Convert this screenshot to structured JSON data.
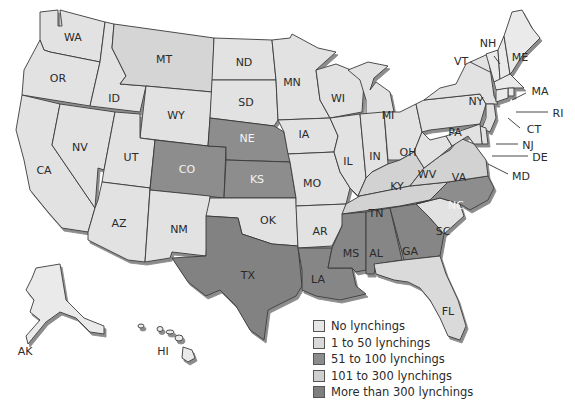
{
  "map": {
    "type": "choropleth",
    "region": "United States",
    "colors": {
      "none": "#e6e6e6",
      "1_50": "#d9d9d9",
      "51_100": "#8c8c8c",
      "101_300": "#c9c9c9",
      "over_300": "#7f7f7f"
    },
    "legend": [
      {
        "key": "none",
        "label": "No lynchings",
        "color": "#e6e6e6"
      },
      {
        "key": "1_50",
        "label": "1 to 50 lynchings",
        "color": "#d9d9d9"
      },
      {
        "key": "51_100",
        "label": "51 to 100 lynchings",
        "color": "#8c8c8c"
      },
      {
        "key": "101_300",
        "label": "101 to 300 lynchings",
        "color": "#cfcfcf"
      },
      {
        "key": "over_300",
        "label": "More than 300 lynchings",
        "color": "#7f7f7f"
      }
    ],
    "states": {
      "WA": "WA",
      "OR": "OR",
      "CA": "CA",
      "ID": "ID",
      "NV": "NV",
      "MT": "MT",
      "WY": "WY",
      "UT": "UT",
      "AZ": "AZ",
      "CO": "CO",
      "NM": "NM",
      "ND": "ND",
      "SD": "SD",
      "NE": "NE",
      "KS": "KS",
      "OK": "OK",
      "TX": "TX",
      "MN": "MN",
      "IA": "IA",
      "MO": "MO",
      "AR": "AR",
      "LA": "LA",
      "WI": "WI",
      "IL": "IL",
      "MI": "MI",
      "IN": "IN",
      "OH": "OH",
      "KY": "KY",
      "TN": "TN",
      "MS": "MS",
      "AL": "AL",
      "GA": "GA",
      "FL": "FL",
      "SC": "SC",
      "NC": "NC",
      "VA": "VA",
      "WV": "WV",
      "PA": "PA",
      "NY": "NY",
      "VT": "VT",
      "NH": "NH",
      "ME": "ME",
      "MA": "MA",
      "RI": "RI",
      "CT": "CT",
      "NJ": "NJ",
      "DE": "DE",
      "MD": "MD",
      "AK": "AK",
      "HI": "HI"
    }
  }
}
